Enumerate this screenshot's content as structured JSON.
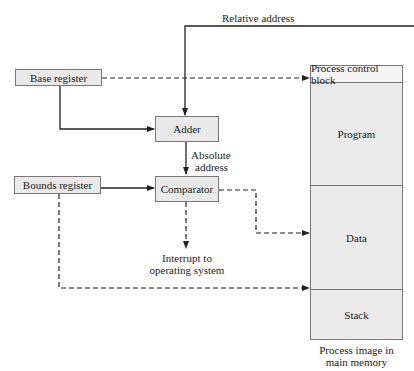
{
  "diagram": {
    "type": "hardware-address-translation",
    "inputs": {
      "relative_address": "Relative address"
    },
    "registers": {
      "base": "Base register",
      "bounds": "Bounds register"
    },
    "units": {
      "adder": "Adder",
      "comparator": "Comparator"
    },
    "labels": {
      "absolute_line1": "Absolute",
      "absolute_line2": "address",
      "interrupt_line1": "Interrupt to",
      "interrupt_line2": "operating system"
    },
    "memory": {
      "segments": {
        "pcb": "Process control block",
        "program": "Program",
        "data": "Data",
        "stack": "Stack"
      },
      "caption_line1": "Process image in",
      "caption_line2": "main memory"
    },
    "edges": [
      {
        "from": "relative_address",
        "to": "adder",
        "style": "solid"
      },
      {
        "from": "base_register",
        "to": "adder",
        "style": "solid"
      },
      {
        "from": "base_register",
        "to": "process_control_block",
        "style": "dashed"
      },
      {
        "from": "adder",
        "to": "comparator",
        "label": "Absolute address",
        "style": "solid"
      },
      {
        "from": "bounds_register",
        "to": "comparator",
        "style": "solid"
      },
      {
        "from": "comparator",
        "to": "interrupt",
        "style": "dashed"
      },
      {
        "from": "comparator",
        "to": "data",
        "style": "dashed"
      },
      {
        "from": "bounds_register",
        "to": "stack",
        "style": "dashed"
      }
    ]
  }
}
